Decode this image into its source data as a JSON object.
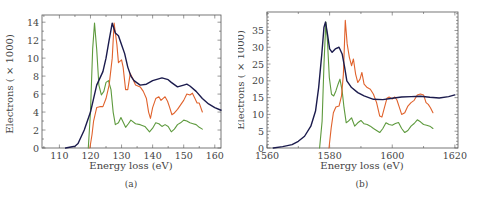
{
  "chart_data": [
    {
      "id": "a",
      "type": "line",
      "caption": "(a)",
      "title": "",
      "xlabel": "Energy loss (eV)",
      "ylabel": "Electrons ( × 1000)",
      "xlim": [
        104.4,
        162
      ],
      "ylim": [
        0,
        14.8
      ],
      "xticks": [
        110,
        120,
        130,
        140,
        150,
        160
      ],
      "yticks": [
        0,
        2,
        4,
        6,
        8,
        10,
        12,
        14
      ],
      "grid": false,
      "legend": null,
      "series": [
        {
          "name": "navy",
          "color": "#1b1b4d",
          "x": [
            112,
            115,
            116,
            118,
            120,
            121,
            122,
            124,
            125,
            126,
            127,
            128,
            129,
            130,
            131,
            132,
            133,
            134,
            136,
            138,
            140,
            143,
            145,
            146,
            148,
            150,
            151,
            152,
            154,
            156,
            158,
            160,
            162
          ],
          "y": [
            0,
            0.2,
            0.5,
            2,
            4,
            5.5,
            7,
            8.5,
            10,
            12,
            13.9,
            12.8,
            12.5,
            11.5,
            10.5,
            9,
            8,
            7.5,
            7,
            7.1,
            7.5,
            7.8,
            7.6,
            7.3,
            6.8,
            7.0,
            7.1,
            6.9,
            6.3,
            5.5,
            4.9,
            4.5,
            4.2
          ]
        },
        {
          "name": "orange",
          "color": "#e0622c",
          "x": [
            119.8,
            120.5,
            121,
            122,
            123,
            124,
            125,
            126,
            127,
            127.6,
            128.5,
            129,
            130,
            130.5,
            131.3,
            132,
            132.8,
            133.5,
            134.5,
            136,
            137,
            138,
            138.7,
            139.3,
            140,
            141,
            142,
            142.7,
            143.3,
            144,
            144.8,
            145.5,
            146.2,
            147,
            148,
            149,
            150,
            151,
            152,
            152.8,
            153.5,
            154.3,
            155,
            156
          ],
          "y": [
            0,
            1.5,
            3,
            4.5,
            4.6,
            4.6,
            5.5,
            7,
            10,
            13.9,
            11.5,
            9.5,
            9.8,
            9,
            6.5,
            6.5,
            8.3,
            7.8,
            7,
            6.8,
            6.3,
            5.5,
            4.0,
            3.3,
            4.5,
            5.5,
            5.7,
            5.3,
            5.5,
            5.7,
            5.2,
            4.5,
            3.7,
            3.9,
            4.3,
            4.8,
            5.3,
            6.0,
            5.9,
            6.1,
            5.6,
            5.0,
            5.0,
            4.0
          ]
        },
        {
          "name": "green",
          "color": "#5e9a3e",
          "x": [
            119.3,
            120,
            120.7,
            121.3,
            122,
            122.7,
            123.5,
            124.3,
            125,
            125.8,
            126.6,
            127.3,
            128,
            129,
            129.8,
            130.5,
            131.3,
            132.2,
            133,
            134.5,
            136,
            137.5,
            139,
            140,
            141,
            142,
            143,
            144,
            145,
            146,
            147,
            148,
            149,
            150,
            151,
            152,
            153,
            154,
            155,
            156
          ],
          "y": [
            0,
            4,
            11,
            13.9,
            11,
            7,
            5.9,
            6.3,
            7.3,
            7.5,
            6.5,
            4,
            2.6,
            2.8,
            3.4,
            2.9,
            2.3,
            2.7,
            3.1,
            2.7,
            2.6,
            2.4,
            1.8,
            2.2,
            2.8,
            2.7,
            2.4,
            2.6,
            2.4,
            1.8,
            2.1,
            2.6,
            2.8,
            3.1,
            3.0,
            2.8,
            2.7,
            2.6,
            2.3,
            2.1
          ]
        }
      ]
    },
    {
      "id": "b",
      "type": "line",
      "caption": "(b)",
      "title": "",
      "xlabel": "Energy loss (eV)",
      "ylabel": "Electrons ( × 1000)",
      "xlim": [
        1560,
        1621
      ],
      "ylim": [
        0,
        40.5
      ],
      "xticks": [
        1560,
        1580,
        1600,
        1620
      ],
      "yticks": [
        0,
        5,
        10,
        15,
        20,
        25,
        30,
        35
      ],
      "grid": false,
      "legend": null,
      "series": [
        {
          "name": "navy",
          "color": "#1b1b4d",
          "x": [
            1562,
            1565,
            1568,
            1570,
            1572,
            1574,
            1575.5,
            1576.5,
            1577.5,
            1578.2,
            1578.7,
            1579.3,
            1580,
            1580.8,
            1581.8,
            1583,
            1584,
            1584.8,
            1585.5,
            1587,
            1589,
            1591,
            1594,
            1597,
            1600,
            1603,
            1606,
            1609,
            1612,
            1615,
            1618,
            1620
          ],
          "y": [
            0,
            0.4,
            1,
            2,
            3.5,
            6.5,
            11,
            18,
            28,
            36,
            37.5,
            34,
            29.5,
            28.5,
            29.5,
            30,
            28,
            24,
            20,
            18,
            16.5,
            15.5,
            14.5,
            14.4,
            14.8,
            15.2,
            15.3,
            15.4,
            15.1,
            14.9,
            15.3,
            15.8
          ]
        },
        {
          "name": "orange",
          "color": "#e0622c",
          "x": [
            1579.8,
            1580.5,
            1581.2,
            1582,
            1583,
            1583.8,
            1584.4,
            1585,
            1585.6,
            1586.3,
            1587,
            1587.6,
            1588.3,
            1589,
            1589.7,
            1590.3,
            1591,
            1592,
            1593,
            1594,
            1595,
            1596,
            1596.7,
            1597.5,
            1598.3,
            1599,
            1600,
            1600.8,
            1601.5,
            1602.3,
            1603,
            1604,
            1605,
            1606,
            1607,
            1608,
            1609,
            1610,
            1610.8,
            1611.5,
            1612.2,
            1613
          ],
          "y": [
            0,
            6,
            10.5,
            12.2,
            12.5,
            15.5,
            22,
            38,
            31,
            27,
            24.5,
            26.5,
            22,
            19.5,
            20.5,
            22.5,
            19,
            18,
            17.5,
            16,
            13.5,
            9.5,
            9.2,
            12,
            14.8,
            15.2,
            14.6,
            15.2,
            14.3,
            12,
            10,
            10.5,
            12.5,
            13.5,
            14.2,
            15.8,
            16.1,
            15.8,
            13.5,
            13,
            12,
            10.5
          ]
        },
        {
          "name": "green",
          "color": "#5e9a3e",
          "x": [
            1576.8,
            1577.6,
            1578.2,
            1578.8,
            1579.3,
            1579.9,
            1580.6,
            1581.3,
            1582,
            1582.7,
            1583.3,
            1584,
            1584.6,
            1585.3,
            1586,
            1587,
            1588,
            1589,
            1590,
            1591,
            1592,
            1593,
            1594,
            1595,
            1596,
            1597,
            1598,
            1599,
            1600,
            1601,
            1602,
            1603,
            1604,
            1605,
            1606,
            1607,
            1608,
            1609,
            1610,
            1611,
            1612,
            1613
          ],
          "y": [
            0,
            8,
            25,
            37.5,
            32,
            21,
            16,
            15.5,
            17,
            19,
            20.5,
            17,
            12,
            7.5,
            8,
            9,
            6.5,
            7.5,
            8.2,
            7.2,
            7,
            6.5,
            5.8,
            5.2,
            4.6,
            5.8,
            7.5,
            7,
            6.8,
            7.3,
            7.6,
            5.8,
            4.6,
            5.2,
            6.5,
            7.3,
            8.4,
            7.8,
            7.0,
            6.8,
            6.5,
            5.8
          ]
        }
      ]
    }
  ],
  "figures": {
    "a": {
      "caption": "(a)",
      "xlabel": "Energy loss (eV)",
      "ylabel": "Electrons ( × 1000)"
    },
    "b": {
      "caption": "(b)",
      "xlabel": "Energy loss (eV)",
      "ylabel": "Electrons ( × 1000)"
    }
  }
}
